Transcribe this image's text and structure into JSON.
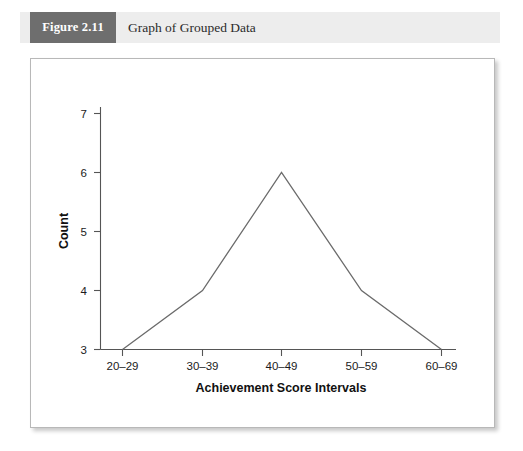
{
  "caption": {
    "figure_number": "Figure 2.11",
    "title": "Graph of Grouped Data"
  },
  "colors": {
    "figure_number_box": "#6e6e6e",
    "caption_band": "#ededed",
    "line": "#6b6b6b",
    "axis": "#555555",
    "panel_border": "#b8b8b8"
  },
  "chart_data": {
    "type": "line",
    "title": "",
    "xlabel": "Achievement Score Intervals",
    "ylabel": "Count",
    "categories": [
      "20–29",
      "30–39",
      "40–49",
      "50–59",
      "60–69"
    ],
    "values": [
      3,
      4,
      6,
      4,
      3
    ],
    "ytick_labels": [
      "3",
      "4",
      "5",
      "6",
      "7"
    ],
    "yticks": [
      3,
      4,
      5,
      6,
      7
    ],
    "ylim": [
      3,
      7
    ],
    "grid": false,
    "legend": null
  }
}
